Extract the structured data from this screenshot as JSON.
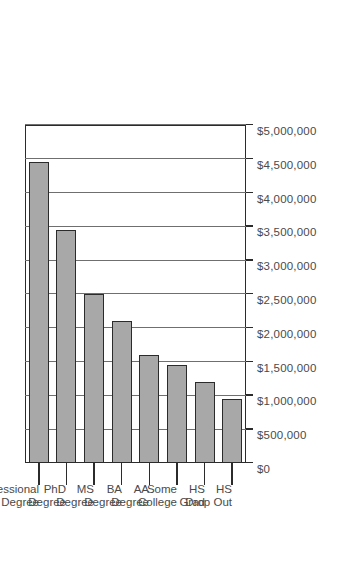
{
  "chart_data": {
    "type": "bar",
    "orientation": "horizontal",
    "title": "",
    "subtitle": "",
    "xlabel": "",
    "ylabel": "",
    "categories": [
      "HS Drop Out",
      "HS Grad",
      "Some College",
      "AA Degree",
      "BA Degree",
      "MS Degree",
      "PhD Degree",
      "Professional Degree"
    ],
    "category_lines": [
      [
        "HS",
        "Drop Out"
      ],
      [
        "HS",
        "Grad"
      ],
      [
        "Some",
        "College"
      ],
      [
        "AA",
        "Degree"
      ],
      [
        "BA",
        "Degree"
      ],
      [
        "MS",
        "Degree"
      ],
      [
        "PhD",
        "Degree"
      ],
      [
        "Professional",
        "Degree"
      ]
    ],
    "values": [
      950000,
      1200000,
      1450000,
      1600000,
      2100000,
      2500000,
      3450000,
      4450000
    ],
    "value_axis_ticks": [
      0,
      500000,
      1000000,
      1500000,
      2000000,
      2500000,
      3000000,
      3500000,
      4000000,
      4500000,
      5000000
    ],
    "tick_labels": [
      "$0",
      "$500,000",
      "$1,000,000",
      "$1,500,000",
      "$2,000,000",
      "$2,500,000",
      "$3,000,000",
      "$3,500,000",
      "$4,000,000",
      "$4,500,000",
      "$5,000,000"
    ],
    "xlim": [
      0,
      5000000
    ],
    "grid": true,
    "grid_axis": "value",
    "legend": false,
    "legend_position": "none",
    "bar_color": "#a8a8a8",
    "bar_edge_color": "#2b2b2b",
    "axis_color": "#2b2b2b",
    "grid_color": "#6f6f6f",
    "background_color": "#ffffff",
    "rotation_degrees": -90
  }
}
